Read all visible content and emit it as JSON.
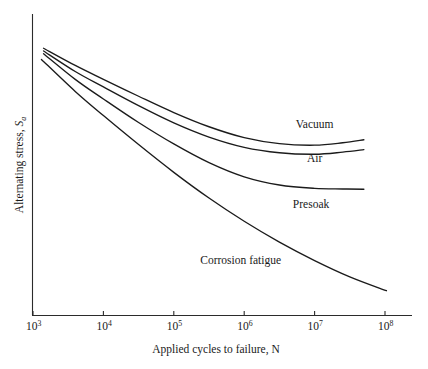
{
  "figure": {
    "background_color": "#ffffff",
    "line_color": "#1b1b1b",
    "axis_color": "#2b2b2b"
  },
  "axes": {
    "x_title_prefix": "Applied cycles to failure, ",
    "x_title_symbol": "N",
    "y_title_prefix": "Alternating stress, ",
    "y_title_symbol": "S",
    "y_title_subscript": "a",
    "x_tick_base": "10",
    "x_tick_exponents": [
      "3",
      "4",
      "5",
      "6",
      "7",
      "8"
    ]
  },
  "curve_labels": {
    "vacuum": "Vacuum",
    "air": "Air",
    "presoak": "Presoak",
    "corrosion": "Corrosion fatigue"
  },
  "chart_data": {
    "type": "line",
    "title": "",
    "xlabel": "Applied cycles to failure, N",
    "ylabel": "Alternating stress, Sa",
    "x_scale": "log10",
    "xlim": [
      1000,
      100000000
    ],
    "x_tick_values": [
      1000,
      10000,
      100000,
      1000000,
      10000000,
      100000000
    ],
    "x_tick_labels": [
      "10^3",
      "10^4",
      "10^5",
      "10^6",
      "10^7",
      "10^8"
    ],
    "ylim": [
      0,
      1
    ],
    "y_tick_labels": [],
    "grid": false,
    "legend": "inline-curve-labels",
    "y_axis_units": "arbitrary (no numeric ticks shown)",
    "series": [
      {
        "name": "Vacuum",
        "label_position": {
          "x_log10": 7.0,
          "y_norm": 0.62
        },
        "points": [
          {
            "x_log10": 3.15,
            "y_norm": 0.885
          },
          {
            "x_log10": 3.6,
            "y_norm": 0.828
          },
          {
            "x_log10": 4.0,
            "y_norm": 0.782
          },
          {
            "x_log10": 4.5,
            "y_norm": 0.726
          },
          {
            "x_log10": 5.0,
            "y_norm": 0.672
          },
          {
            "x_log10": 5.5,
            "y_norm": 0.625
          },
          {
            "x_log10": 6.0,
            "y_norm": 0.589
          },
          {
            "x_log10": 6.5,
            "y_norm": 0.569
          },
          {
            "x_log10": 7.0,
            "y_norm": 0.564
          },
          {
            "x_log10": 7.4,
            "y_norm": 0.572
          },
          {
            "x_log10": 7.7,
            "y_norm": 0.582
          }
        ]
      },
      {
        "name": "Air",
        "label_position": {
          "x_log10": 7.0,
          "y_norm": 0.507
        },
        "points": [
          {
            "x_log10": 3.15,
            "y_norm": 0.876
          },
          {
            "x_log10": 3.6,
            "y_norm": 0.808
          },
          {
            "x_log10": 4.0,
            "y_norm": 0.757
          },
          {
            "x_log10": 4.5,
            "y_norm": 0.695
          },
          {
            "x_log10": 5.0,
            "y_norm": 0.638
          },
          {
            "x_log10": 5.5,
            "y_norm": 0.591
          },
          {
            "x_log10": 6.0,
            "y_norm": 0.557
          },
          {
            "x_log10": 6.5,
            "y_norm": 0.539
          },
          {
            "x_log10": 7.0,
            "y_norm": 0.534
          },
          {
            "x_log10": 7.4,
            "y_norm": 0.541
          },
          {
            "x_log10": 7.7,
            "y_norm": 0.549
          }
        ]
      },
      {
        "name": "Presoak",
        "label_position": {
          "x_log10": 6.95,
          "y_norm": 0.355
        },
        "points": [
          {
            "x_log10": 3.15,
            "y_norm": 0.867
          },
          {
            "x_log10": 3.6,
            "y_norm": 0.782
          },
          {
            "x_log10": 4.0,
            "y_norm": 0.717
          },
          {
            "x_log10": 4.5,
            "y_norm": 0.639
          },
          {
            "x_log10": 5.0,
            "y_norm": 0.568
          },
          {
            "x_log10": 5.5,
            "y_norm": 0.506
          },
          {
            "x_log10": 6.0,
            "y_norm": 0.459
          },
          {
            "x_log10": 6.5,
            "y_norm": 0.432
          },
          {
            "x_log10": 7.0,
            "y_norm": 0.421
          },
          {
            "x_log10": 7.4,
            "y_norm": 0.419
          },
          {
            "x_log10": 7.7,
            "y_norm": 0.418
          }
        ]
      },
      {
        "name": "Corrosion fatigue",
        "label_position": {
          "x_log10": 5.95,
          "y_norm": 0.17
        },
        "points": [
          {
            "x_log10": 3.12,
            "y_norm": 0.848
          },
          {
            "x_log10": 3.6,
            "y_norm": 0.742
          },
          {
            "x_log10": 4.0,
            "y_norm": 0.662
          },
          {
            "x_log10": 4.5,
            "y_norm": 0.566
          },
          {
            "x_log10": 5.0,
            "y_norm": 0.474
          },
          {
            "x_log10": 5.5,
            "y_norm": 0.389
          },
          {
            "x_log10": 6.0,
            "y_norm": 0.312
          },
          {
            "x_log10": 6.5,
            "y_norm": 0.243
          },
          {
            "x_log10": 7.0,
            "y_norm": 0.182
          },
          {
            "x_log10": 7.5,
            "y_norm": 0.128
          },
          {
            "x_log10": 8.02,
            "y_norm": 0.082
          }
        ]
      }
    ]
  }
}
